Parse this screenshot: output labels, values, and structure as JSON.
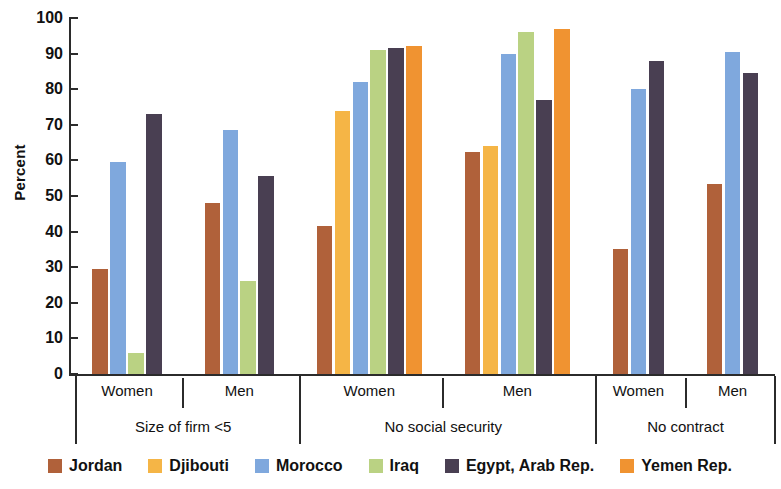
{
  "chart_data": {
    "type": "bar",
    "title": "",
    "subtitle": "",
    "xlabel": "",
    "ylabel": "Percent",
    "ylim": [
      0,
      100
    ],
    "ytick_step": 10,
    "yticks": [
      0,
      10,
      20,
      30,
      40,
      50,
      60,
      70,
      80,
      90,
      100
    ],
    "grid": false,
    "legend_position": "bottom",
    "grouping": "grouped bars, three indicator groups each split by Women / Men",
    "series": [
      {
        "name": "Jordan",
        "color": "#b0613a"
      },
      {
        "name": "Djibouti",
        "color": "#f5b546"
      },
      {
        "name": "Morocco",
        "color": "#7fa8dd"
      },
      {
        "name": "Iraq",
        "color": "#bad283"
      },
      {
        "name": "Egypt, Arab Rep.",
        "color": "#493f52"
      },
      {
        "name": "Yemen Rep.",
        "color": "#f09331"
      }
    ],
    "groups": [
      {
        "label": "Size of firm <5",
        "subgroups": [
          {
            "label": "Women",
            "bars": [
              {
                "series": "Jordan",
                "value": 29.5
              },
              {
                "series": "Morocco",
                "value": 59.5
              },
              {
                "series": "Iraq",
                "value": 6.0
              },
              {
                "series": "Egypt, Arab Rep.",
                "value": 73.0
              }
            ]
          },
          {
            "label": "Men",
            "bars": [
              {
                "series": "Jordan",
                "value": 48.0
              },
              {
                "series": "Morocco",
                "value": 68.5
              },
              {
                "series": "Iraq",
                "value": 26.0
              },
              {
                "series": "Egypt, Arab Rep.",
                "value": 55.5
              }
            ]
          }
        ]
      },
      {
        "label": "No social security",
        "subgroups": [
          {
            "label": "Women",
            "bars": [
              {
                "series": "Jordan",
                "value": 41.5
              },
              {
                "series": "Djibouti",
                "value": 74.0
              },
              {
                "series": "Morocco",
                "value": 82.0
              },
              {
                "series": "Iraq",
                "value": 91.0
              },
              {
                "series": "Egypt, Arab Rep.",
                "value": 91.5
              },
              {
                "series": "Yemen Rep.",
                "value": 92.0
              }
            ]
          },
          {
            "label": "Men",
            "bars": [
              {
                "series": "Jordan",
                "value": 62.5
              },
              {
                "series": "Djibouti",
                "value": 64.0
              },
              {
                "series": "Morocco",
                "value": 90.0
              },
              {
                "series": "Iraq",
                "value": 96.0
              },
              {
                "series": "Egypt, Arab Rep.",
                "value": 77.0
              },
              {
                "series": "Yemen Rep.",
                "value": 97.0
              }
            ]
          }
        ]
      },
      {
        "label": "No contract",
        "subgroups": [
          {
            "label": "Women",
            "bars": [
              {
                "series": "Jordan",
                "value": 35.0
              },
              {
                "series": "Morocco",
                "value": 80.0
              },
              {
                "series": "Egypt, Arab Rep.",
                "value": 88.0
              }
            ]
          },
          {
            "label": "Men",
            "bars": [
              {
                "series": "Jordan",
                "value": 53.5
              },
              {
                "series": "Morocco",
                "value": 90.5
              },
              {
                "series": "Egypt, Arab Rep.",
                "value": 84.5
              }
            ]
          }
        ]
      }
    ]
  }
}
